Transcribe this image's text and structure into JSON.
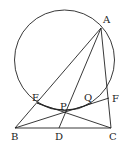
{
  "diagram": {
    "type": "geometry",
    "circle": {
      "cx": 64.5,
      "cy": 60,
      "r": 50
    },
    "points": {
      "A": {
        "x": 101,
        "y": 28,
        "label": "A",
        "lx": 103,
        "ly": 23
      },
      "B": {
        "x": 15,
        "y": 128,
        "label": "B",
        "lx": 11,
        "ly": 140
      },
      "C": {
        "x": 111,
        "y": 128,
        "label": "C",
        "lx": 109,
        "ly": 140
      },
      "D": {
        "x": 59,
        "y": 128,
        "label": "D",
        "lx": 55,
        "ly": 140
      },
      "E": {
        "x": 37,
        "y": 103,
        "label": "E",
        "lx": 32,
        "ly": 101
      },
      "P": {
        "x": 65,
        "y": 113,
        "label": "P",
        "lx": 60,
        "ly": 110
      },
      "Q": {
        "x": 92,
        "y": 103,
        "label": "Q",
        "lx": 84,
        "ly": 101
      },
      "F": {
        "x": 109,
        "y": 98,
        "label": "F",
        "lx": 112,
        "ly": 102
      }
    },
    "segments": [
      "AB",
      "AC",
      "AD",
      "BC",
      "BF",
      "CE",
      "AP"
    ],
    "labels": [
      "A",
      "B",
      "C",
      "D",
      "E",
      "P",
      "Q",
      "F"
    ]
  }
}
